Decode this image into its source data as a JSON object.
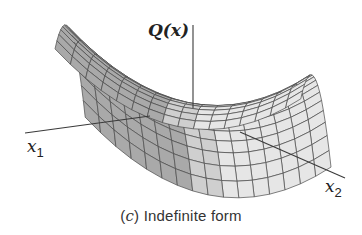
{
  "figure": {
    "caption_prefix": "(",
    "caption_letter": "c",
    "caption_suffix": ") Indefinite form",
    "axes": {
      "vertical_label": "Q(x)",
      "x1_label": "x",
      "x1_sub": "1",
      "x2_label": "x",
      "x2_sub": "2"
    },
    "surface": {
      "type": "saddle",
      "equation": "Q(x) = x1^2 - x2^2",
      "grid_u": 16,
      "grid_v": 16,
      "colors": {
        "face_light": "#e6e6e6",
        "face_mid": "#cfcfcf",
        "face_dark": "#a9a9a9",
        "mesh_line": "#4a4a4a"
      }
    }
  }
}
